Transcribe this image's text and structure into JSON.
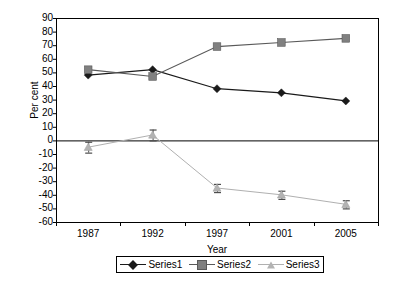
{
  "chart_data": {
    "type": "line",
    "title": "",
    "xlabel": "Year",
    "ylabel": "Per cent",
    "categories": [
      "1987",
      "1992",
      "1997",
      "2001",
      "2005"
    ],
    "x": [
      1987,
      1992,
      1997,
      2001,
      2005
    ],
    "ylim": [
      -60,
      90
    ],
    "yticks": [
      90,
      80,
      70,
      60,
      50,
      40,
      30,
      20,
      10,
      0,
      -10,
      -20,
      -30,
      -40,
      -50,
      -60
    ],
    "ytick_labels": [
      "90",
      "80",
      "70",
      "60",
      "50",
      "40",
      "30",
      "20",
      "10",
      "0",
      "-10",
      "-20",
      "-30",
      "-40",
      "-50",
      "-60"
    ],
    "grid": false,
    "legend_position": "bottom",
    "zero_line": 0,
    "series": [
      {
        "name": "Series1",
        "marker": "diamond",
        "color": "#1a1a1a",
        "line_color": "#1a1a1a",
        "values": [
          48,
          52,
          38,
          35,
          29
        ],
        "error_bars": null
      },
      {
        "name": "Series2",
        "marker": "square",
        "color": "#808080",
        "line_color": "#595959",
        "values": [
          52,
          47,
          69,
          72,
          75
        ],
        "error_bars": null
      },
      {
        "name": "Series3",
        "marker": "triangle",
        "color": "#b3b3b3",
        "line_color": "#b0b0b0",
        "values": [
          -5,
          4,
          -35,
          -40,
          -47
        ],
        "error_bars": [
          4,
          4,
          3,
          3,
          3
        ]
      }
    ]
  },
  "legend": {
    "entries": [
      {
        "label": "Series1"
      },
      {
        "label": "Series2"
      },
      {
        "label": "Series3"
      }
    ]
  },
  "axes": {
    "y_title": "Per cent",
    "x_title": "Year"
  }
}
